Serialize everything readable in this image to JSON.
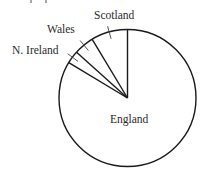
{
  "chart_data": {
    "type": "pie",
    "title": "",
    "categories": [
      "England",
      "N. Ireland",
      "Wales",
      "Scotland"
    ],
    "values": [
      83.6,
      3.0,
      4.8,
      8.6
    ],
    "unit": "percent (estimated from slice angles)",
    "start_angle_deg": 0,
    "direction": "counterclockwise from 12 o'clock (Scotland, Wales, N. Ireland), England fills remainder",
    "slices": [
      {
        "label": "Scotland",
        "value": 8.6,
        "angle_deg": 31
      },
      {
        "label": "Wales",
        "value": 4.8,
        "angle_deg": 17
      },
      {
        "label": "N. Ireland",
        "value": 3.0,
        "angle_deg": 11
      },
      {
        "label": "England",
        "value": 83.6,
        "angle_deg": 301
      }
    ],
    "legend": "none (direct labels with leader lines)",
    "fill": "#ffffff",
    "stroke": "#1a1a1a"
  },
  "labels": {
    "scotland": "Scotland",
    "wales": "Wales",
    "n_ireland": "N. Ireland",
    "england": "England"
  }
}
